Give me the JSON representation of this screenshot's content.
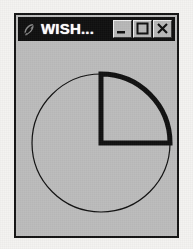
{
  "window": {
    "title": "WISH...",
    "app_icon": "wish-feather-icon",
    "background_color": "#bdbdbd",
    "titlebar_color": "#101010",
    "titlebar_text_color": "#ffffff",
    "border_color": "#141414",
    "buttons": [
      {
        "name": "minimize",
        "label": "_",
        "glyph": "minimize-icon"
      },
      {
        "name": "maximize",
        "label": "□",
        "glyph": "maximize-icon"
      },
      {
        "name": "close",
        "label": "×",
        "glyph": "close-icon"
      }
    ]
  },
  "canvas": {
    "name": "tk-canvas",
    "background_color": "#bcbcbc",
    "outline_color": "#111111",
    "shapes": [
      {
        "name": "circle-outline",
        "type": "oval",
        "center_x": 83,
        "center_y": 102,
        "radius": 69,
        "stroke_width": 1,
        "fill": "none"
      },
      {
        "name": "pie-wedge-arc",
        "type": "arc",
        "style": "arc-with-radii",
        "center_x": 83,
        "center_y": 102,
        "radius": 69,
        "start_angle_deg": 0,
        "extent_deg": 90,
        "stroke_width": 5,
        "fill": "none"
      }
    ]
  },
  "page": {
    "background_color": "#f4f3f1"
  }
}
